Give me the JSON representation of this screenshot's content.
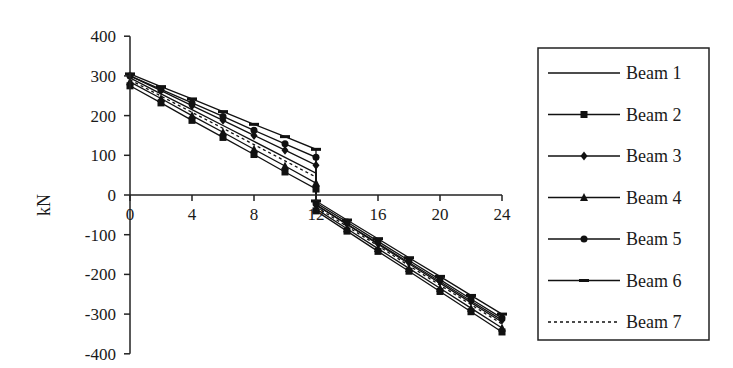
{
  "chart_data": {
    "type": "line",
    "title": "",
    "xlabel": "",
    "ylabel": "kN",
    "xlim": [
      0,
      24
    ],
    "ylim": [
      -400,
      400
    ],
    "x_ticks": [
      0,
      4,
      8,
      12,
      16,
      20,
      24
    ],
    "y_ticks": [
      400,
      300,
      200,
      100,
      0,
      -100,
      -200,
      -300,
      -400
    ],
    "grid": false,
    "legend_position": "right",
    "x": [
      0,
      2,
      4,
      6,
      8,
      10,
      12,
      12,
      14,
      16,
      18,
      20,
      22,
      24
    ],
    "series": [
      {
        "name": "Beam 1",
        "marker": "none",
        "dash": "solid",
        "values": [
          295,
          255,
          215,
          175,
          135,
          95,
          55,
          -25,
          -74,
          -124,
          -173,
          -222,
          -271,
          -320
        ]
      },
      {
        "name": "Beam 2",
        "marker": "square",
        "dash": "solid",
        "values": [
          275,
          232,
          188,
          145,
          102,
          58,
          15,
          -40,
          -91,
          -142,
          -192,
          -243,
          -294,
          -345
        ]
      },
      {
        "name": "Beam 3",
        "marker": "diamond",
        "dash": "solid",
        "values": [
          300,
          263,
          225,
          188,
          150,
          113,
          75,
          -25,
          -73,
          -122,
          -170,
          -218,
          -267,
          -315
        ]
      },
      {
        "name": "Beam 4",
        "marker": "triangle",
        "dash": "solid",
        "values": [
          285,
          243,
          200,
          158,
          115,
          73,
          30,
          -35,
          -85,
          -135,
          -185,
          -235,
          -285,
          -335
        ]
      },
      {
        "name": "Beam 5",
        "marker": "circle",
        "dash": "solid",
        "values": [
          300,
          266,
          232,
          198,
          163,
          129,
          95,
          -20,
          -68,
          -117,
          -165,
          -213,
          -262,
          -310
        ]
      },
      {
        "name": "Beam 6",
        "marker": "bar",
        "dash": "solid",
        "values": [
          305,
          273,
          242,
          210,
          178,
          147,
          115,
          -15,
          -63,
          -110,
          -158,
          -205,
          -253,
          -300
        ]
      },
      {
        "name": "Beam 7",
        "marker": "none",
        "dash": "dotted",
        "values": [
          290,
          249,
          208,
          168,
          127,
          86,
          45,
          -30,
          -79,
          -128,
          -178,
          -227,
          -276,
          -325
        ]
      }
    ]
  },
  "legend": {
    "items": [
      "Beam 1",
      "Beam 2",
      "Beam 3",
      "Beam 4",
      "Beam 5",
      "Beam 6",
      "Beam 7"
    ]
  },
  "colors": {
    "line": "#111111",
    "axis": "#222222",
    "background": "#ffffff"
  }
}
